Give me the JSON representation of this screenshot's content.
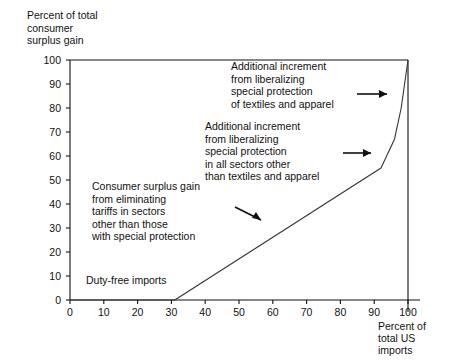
{
  "axes": {
    "y_title": "Percent of total\nconsumer\nsurplus gain",
    "x_title": "Percent of\ntotal US\nimports",
    "y_ticks": [
      "0",
      "10",
      "20",
      "30",
      "40",
      "50",
      "60",
      "70",
      "80",
      "90",
      "100"
    ],
    "x_ticks": [
      "0",
      "10",
      "20",
      "30",
      "40",
      "50",
      "60",
      "70",
      "80",
      "90",
      "100"
    ]
  },
  "annotations": [
    {
      "id": "a0",
      "text": "Additional increment\nfrom liberalizing\nspecial protection\nof textiles and apparel"
    },
    {
      "id": "a1",
      "text": "Additional increment\nfrom liberalizing\nspecial protection\nin all sectors other\nthan textiles and apparel"
    },
    {
      "id": "a2",
      "text": "Consumer surplus gain\nfrom eliminating\ntariffs in sectors\nother than those\nwith special protection"
    },
    {
      "id": "a3",
      "text": "Duty-free imports"
    }
  ],
  "colors": {
    "line": "#333333",
    "axis": "#111111",
    "text": "#111111",
    "background": "#ffffff"
  },
  "chart_data": {
    "type": "line",
    "title": "",
    "xlabel": "Percent of total US imports",
    "ylabel": "Percent of total consumer surplus gain",
    "xlim": [
      0,
      100
    ],
    "ylim": [
      0,
      100
    ],
    "grid": false,
    "legend": "none",
    "x": [
      0,
      31,
      92,
      96,
      98,
      100
    ],
    "y": [
      0,
      0,
      55,
      67,
      80,
      100
    ],
    "series": [
      {
        "name": "Cumulative consumer surplus gain",
        "x": [
          0,
          31,
          92,
          96,
          98,
          100
        ],
        "values": [
          0,
          0,
          55,
          67,
          80,
          100
        ]
      }
    ],
    "segments": [
      {
        "label": "Duty-free imports",
        "x_range": [
          0,
          31
        ],
        "y_range": [
          0,
          0
        ]
      },
      {
        "label": "Consumer surplus gain from eliminating tariffs in sectors other than those with special protection",
        "x_range": [
          31,
          92
        ],
        "y_range": [
          0,
          55
        ]
      },
      {
        "label": "Additional increment from liberalizing special protection in all sectors other than textiles and apparel",
        "x_range": [
          92,
          96
        ],
        "y_range": [
          55,
          67
        ]
      },
      {
        "label": "Additional increment from liberalizing special protection of textiles and apparel",
        "x_range": [
          96,
          100
        ],
        "y_range": [
          67,
          100
        ]
      }
    ]
  }
}
